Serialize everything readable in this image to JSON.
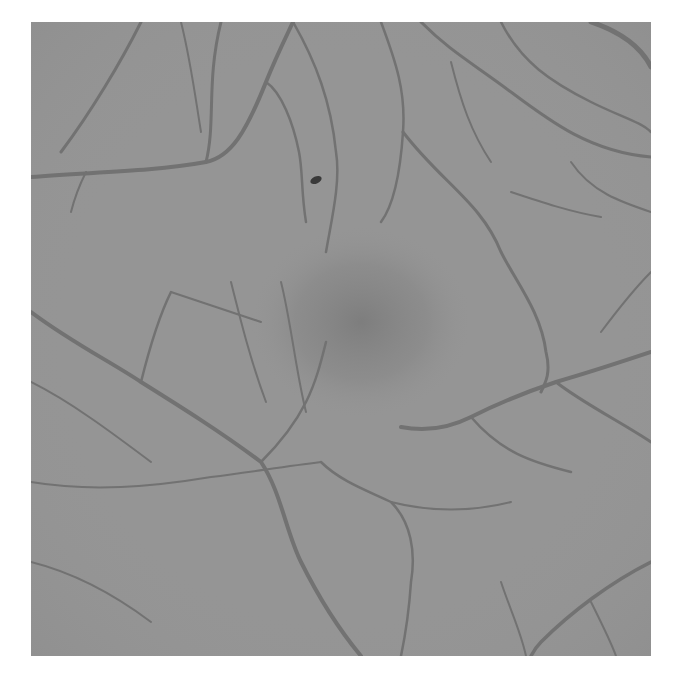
{
  "image": {
    "subject": "grayscale retinal fundus photograph",
    "background_color": "#ffffff",
    "field_color": "#939393",
    "vessel_color": "#6e6e6e",
    "macula_color": "#7d7d7d",
    "features": [
      "retinal-vessels",
      "macula",
      "small-dark-lesion"
    ]
  }
}
